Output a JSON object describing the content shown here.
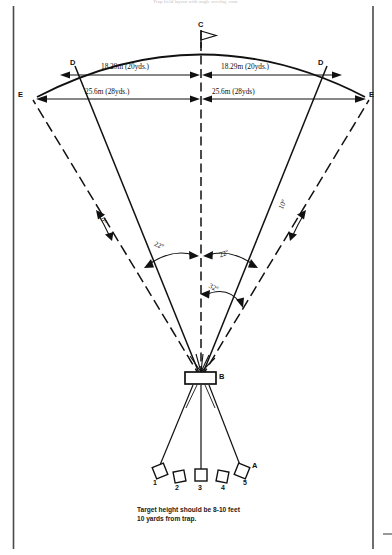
{
  "header": {
    "running_text": "Trap field layout with angle overlay, cont."
  },
  "points": {
    "c": "C",
    "b": "B",
    "a": "A",
    "d_left": "D",
    "d_right": "D",
    "e_left": "E",
    "e_right": "E"
  },
  "dimensions": {
    "top_left": "18.29m (20yds.)",
    "top_right": "18.29m (20yds.)",
    "bottom_left": "25.6m (28yds.)",
    "bottom_right": "25.6m (28yds)"
  },
  "angles": {
    "left_outer": "10º",
    "right_outer": "10º",
    "left_inner": "22º",
    "right_inner": "22º",
    "right_wide": "32º"
  },
  "stations": [
    {
      "number": "1"
    },
    {
      "number": "2"
    },
    {
      "number": "3"
    },
    {
      "number": "4"
    },
    {
      "number": "5"
    }
  ],
  "caption": {
    "line1": "Target height should be 8-10 feet",
    "line2": "10 yards from trap."
  },
  "icons": {
    "flag": "flag-icon",
    "trap_house": "trap-house-icon"
  },
  "colors": {
    "ink": "#111111",
    "border": "#4a4a4a",
    "paper": "#ffffff"
  }
}
